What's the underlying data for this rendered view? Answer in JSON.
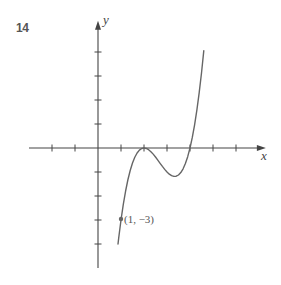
{
  "figure": {
    "number_label": "14"
  },
  "colors": {
    "axis": "#444444",
    "curve": "#666666",
    "text": "#555555",
    "background": "#ffffff"
  },
  "chart_data": {
    "type": "line",
    "title": "",
    "figure_number": "14",
    "xlabel": "x",
    "ylabel": "y",
    "xlim": [
      -3.0,
      7.3
    ],
    "ylim": [
      -5.0,
      5.3
    ],
    "x_ticks": [
      -2,
      -1,
      1,
      2,
      3,
      4,
      5,
      6
    ],
    "y_ticks": [
      -4,
      -3,
      -2,
      -1,
      1,
      2,
      3,
      4
    ],
    "tick_labels_shown": false,
    "grid": false,
    "legend": null,
    "series": [
      {
        "name": "curve",
        "description": "cubic with double root at x=2 and single root at x=4, passing through (1,-3)",
        "x": [
          0.87,
          0.9,
          1.0,
          1.1,
          1.2,
          1.3,
          1.4,
          1.5,
          1.6,
          1.7,
          1.8,
          1.9,
          2.0,
          2.1,
          2.2,
          2.3,
          2.4,
          2.5,
          2.6,
          2.7,
          2.8,
          2.9,
          3.0,
          3.1,
          3.2,
          3.3,
          3.4,
          3.5,
          3.6,
          3.7,
          3.8,
          3.9,
          4.0,
          4.1,
          4.2,
          4.3,
          4.4,
          4.5,
          4.6
        ],
        "y": [
          -4.0,
          -3.751,
          -3.0,
          -2.349,
          -1.792,
          -1.323,
          -0.936,
          -0.625,
          -0.384,
          -0.207,
          -0.088,
          -0.021,
          0.0,
          -0.019,
          -0.072,
          -0.153,
          -0.256,
          -0.375,
          -0.504,
          -0.637,
          -0.768,
          -0.891,
          -1.0,
          -1.089,
          -1.152,
          -1.183,
          -1.176,
          -1.125,
          -1.024,
          -0.867,
          -0.648,
          -0.361,
          0.0,
          0.441,
          0.968,
          1.587,
          2.304,
          3.125,
          4.056
        ]
      }
    ],
    "annotations": [
      {
        "text": "(1, −3)",
        "x": 1,
        "y": -3,
        "marker": "dot"
      }
    ]
  }
}
